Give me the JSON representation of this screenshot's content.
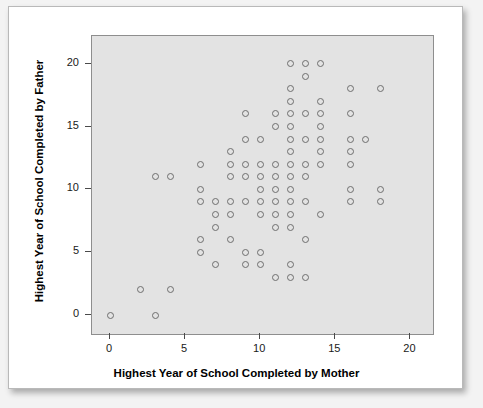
{
  "chart_data": {
    "type": "scatter",
    "title": "",
    "xlabel": "Highest Year of School Completed by Mother",
    "ylabel": "Highest Year of School Completed by Father",
    "xlim": [
      -1.2,
      21.5
    ],
    "ylim": [
      -1.5,
      22.2
    ],
    "xticks": [
      0,
      5,
      10,
      15,
      20
    ],
    "yticks": [
      0,
      5,
      10,
      15,
      20
    ],
    "xticklabels": [
      "0",
      "5",
      "10",
      "15",
      "20"
    ],
    "yticklabels": [
      "0",
      "5",
      "10",
      "15",
      "20"
    ],
    "grid": false,
    "legend": null,
    "marker": "open-circle",
    "marker_color": "#6e6e6e",
    "panel_background": "#e3e3e3",
    "panel_border": "#8e8e8e",
    "card_background": "#ffffff",
    "points": [
      [
        0,
        0
      ],
      [
        2,
        2
      ],
      [
        3,
        0
      ],
      [
        3,
        11
      ],
      [
        4,
        2
      ],
      [
        4,
        11
      ],
      [
        6,
        5
      ],
      [
        6,
        6
      ],
      [
        6,
        9
      ],
      [
        6,
        10
      ],
      [
        6,
        12
      ],
      [
        7,
        4
      ],
      [
        7,
        7
      ],
      [
        7,
        8
      ],
      [
        7,
        9
      ],
      [
        8,
        6
      ],
      [
        8,
        8
      ],
      [
        8,
        9
      ],
      [
        8,
        11
      ],
      [
        8,
        12
      ],
      [
        8,
        13
      ],
      [
        9,
        4
      ],
      [
        9,
        5
      ],
      [
        9,
        9
      ],
      [
        9,
        11
      ],
      [
        9,
        12
      ],
      [
        9,
        14
      ],
      [
        9,
        16
      ],
      [
        10,
        4
      ],
      [
        10,
        5
      ],
      [
        10,
        8
      ],
      [
        10,
        9
      ],
      [
        10,
        10
      ],
      [
        10,
        11
      ],
      [
        10,
        12
      ],
      [
        10,
        14
      ],
      [
        11,
        3
      ],
      [
        11,
        7
      ],
      [
        11,
        8
      ],
      [
        11,
        9
      ],
      [
        11,
        10
      ],
      [
        11,
        11
      ],
      [
        11,
        12
      ],
      [
        11,
        15
      ],
      [
        11,
        16
      ],
      [
        12,
        3
      ],
      [
        12,
        4
      ],
      [
        12,
        7
      ],
      [
        12,
        8
      ],
      [
        12,
        9
      ],
      [
        12,
        10
      ],
      [
        12,
        11
      ],
      [
        12,
        12
      ],
      [
        12,
        13
      ],
      [
        12,
        14
      ],
      [
        12,
        15
      ],
      [
        12,
        16
      ],
      [
        12,
        17
      ],
      [
        12,
        18
      ],
      [
        12,
        20
      ],
      [
        13,
        3
      ],
      [
        13,
        6
      ],
      [
        13,
        9
      ],
      [
        13,
        11
      ],
      [
        13,
        12
      ],
      [
        13,
        14
      ],
      [
        13,
        16
      ],
      [
        13,
        19
      ],
      [
        13,
        20
      ],
      [
        14,
        8
      ],
      [
        14,
        12
      ],
      [
        14,
        13
      ],
      [
        14,
        14
      ],
      [
        14,
        15
      ],
      [
        14,
        16
      ],
      [
        14,
        17
      ],
      [
        14,
        20
      ],
      [
        16,
        9
      ],
      [
        16,
        10
      ],
      [
        16,
        12
      ],
      [
        16,
        13
      ],
      [
        16,
        14
      ],
      [
        16,
        16
      ],
      [
        16,
        18
      ],
      [
        17,
        14
      ],
      [
        18,
        9
      ],
      [
        18,
        10
      ],
      [
        18,
        18
      ]
    ]
  }
}
